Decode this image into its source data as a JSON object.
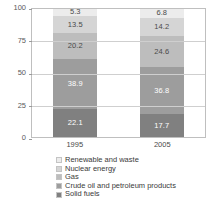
{
  "chart_data": {
    "type": "bar",
    "subtype": "stacked-bar-100-percent",
    "title": "",
    "xlabel": "",
    "ylabel": "",
    "categories": [
      "1995",
      "2005"
    ],
    "ylim": [
      0,
      100
    ],
    "yticks": [
      0,
      25,
      50,
      75,
      100
    ],
    "ytick_labels": [
      "0",
      "25",
      "50",
      "75",
      "100"
    ],
    "grid": true,
    "grid_axis": "y",
    "legend_position": "bottom",
    "stack_order_bottom_to_top": [
      "Solid fuels",
      "Crude oil and petroleum products",
      "Gas",
      "Nuclear energy",
      "Renewable and waste"
    ],
    "series": [
      {
        "name": "Renewable and waste",
        "color": "#ececec",
        "label_color": "dark",
        "values": [
          5.3,
          6.8
        ],
        "value_labels": [
          "5.3",
          "6.8"
        ]
      },
      {
        "name": "Nuclear energy",
        "color": "#d5d5d5",
        "label_color": "dark",
        "values": [
          13.5,
          14.2
        ],
        "value_labels": [
          "13.5",
          "14.2"
        ]
      },
      {
        "name": "Gas",
        "color": "#bdbdbd",
        "label_color": "dark",
        "values": [
          20.2,
          24.6
        ],
        "value_labels": [
          "20.2",
          "24.6"
        ]
      },
      {
        "name": "Crude oil and petroleum products",
        "color": "#9d9d9d",
        "label_color": "light",
        "values": [
          38.9,
          36.8
        ],
        "value_labels": [
          "38.9",
          "36.8"
        ]
      },
      {
        "name": "Solid fuels",
        "color": "#808080",
        "label_color": "light",
        "values": [
          22.1,
          17.7
        ],
        "value_labels": [
          "22.1",
          "17.7"
        ]
      }
    ]
  },
  "legend": {
    "items": [
      {
        "label": "Renewable and waste",
        "color": "#ececec"
      },
      {
        "label": "Nuclear energy",
        "color": "#d5d5d5"
      },
      {
        "label": "Gas",
        "color": "#bdbdbd"
      },
      {
        "label": "Crude oil and petroleum products",
        "color": "#9d9d9d"
      },
      {
        "label": "Solid fuels",
        "color": "#808080"
      }
    ]
  }
}
